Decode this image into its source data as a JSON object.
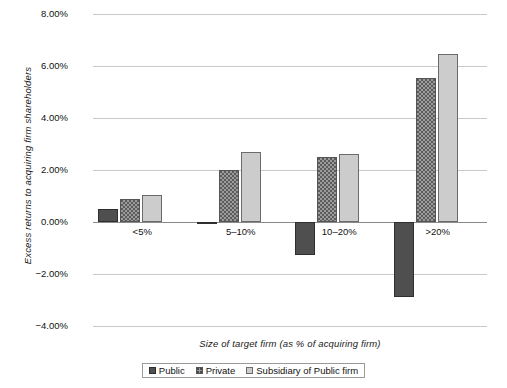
{
  "chart_data": {
    "type": "bar",
    "title": "",
    "subtitle": "",
    "xlabel": "Size of target firm (as % of acquiring firm)",
    "ylabel": "Excess returns to acquiring firm shareholders",
    "categories": [
      "<5%",
      "5–10%",
      "10–20%",
      ">20%"
    ],
    "series": [
      {
        "name": "Public",
        "values": [
          0.5,
          -0.05,
          -1.25,
          -2.88
        ],
        "color": "#4f4f4f"
      },
      {
        "name": "Private",
        "values": [
          0.9,
          2.0,
          2.5,
          5.55
        ],
        "color": "#9b9b9b"
      },
      {
        "name": "Subsidiary of Public firm",
        "values": [
          1.05,
          2.7,
          2.6,
          6.45
        ],
        "color": "#cccccc"
      }
    ],
    "ylim": [
      -4.0,
      8.0
    ],
    "ytick_values": [
      8.0,
      6.0,
      4.0,
      2.0,
      0.0,
      -2.0,
      -4.0
    ],
    "ytick_labels": [
      "8.00%",
      "6.00%",
      "4.00%",
      "2.00%",
      "0.00%",
      "−2.00%",
      "−4.00%"
    ],
    "yunit": "percent",
    "grid": true,
    "grid_axis": "y",
    "legend_position": "bottom",
    "legend_entries": [
      "Public",
      "Private",
      "Subsidiary of Public firm"
    ],
    "axis_colors": {
      "grid": "#c9c9c9",
      "zero_line": "#8a8a8a"
    }
  }
}
